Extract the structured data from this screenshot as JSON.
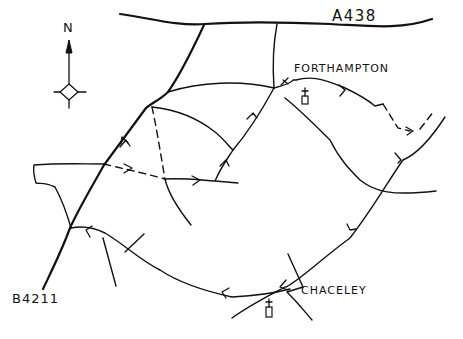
{
  "map": {
    "title": "Hand-drawn walking route map: Forthampton and Chaceley",
    "labels": {
      "north": "N",
      "road_top": "A438",
      "road_bottom_left": "B4211",
      "village_top": "FORTHAMPTON",
      "village_bottom": "CHACELEY"
    },
    "legend": {
      "solid_line": "road / path",
      "dashed_line": "footpath",
      "arrow": "route direction"
    },
    "icons": [
      "compass-rose-icon",
      "north-arrow-icon",
      "church-icon",
      "church-icon",
      "route-direction-arrow-icon",
      "stile-icon"
    ],
    "colors": {
      "ink": "#111111",
      "background": "#ffffff"
    }
  }
}
